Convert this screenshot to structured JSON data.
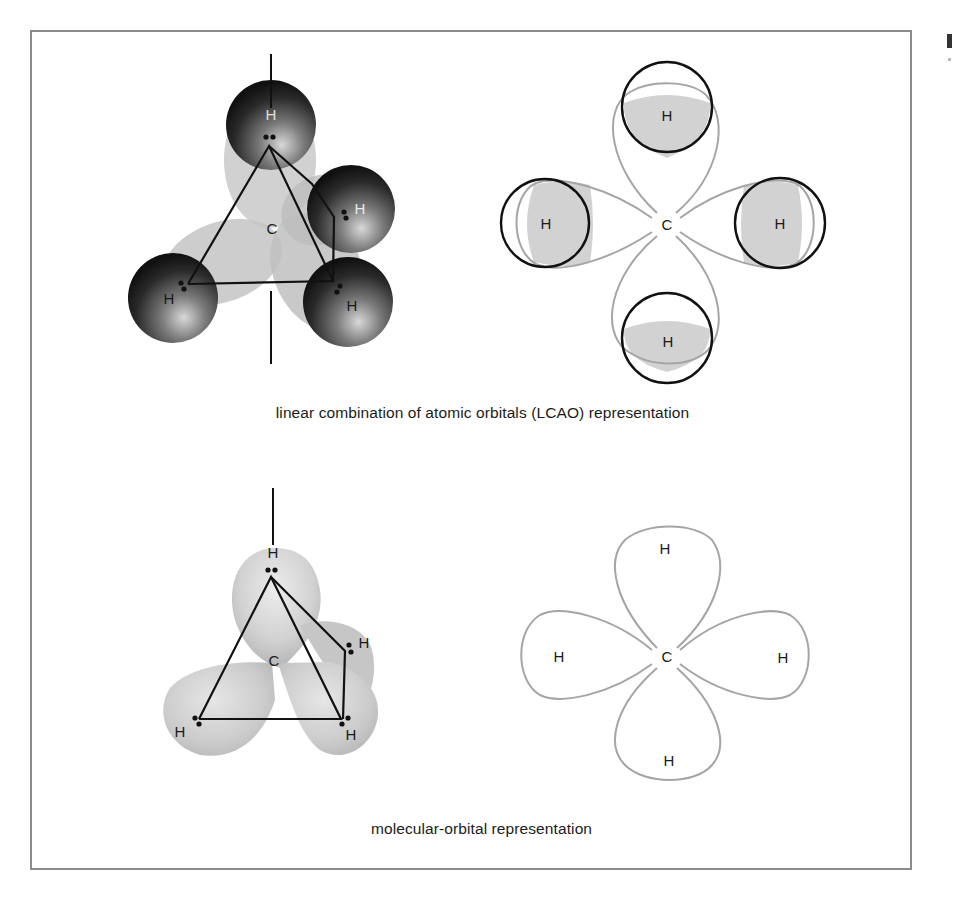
{
  "figure": {
    "type": "chemistry-diagram",
    "panels": [
      {
        "id": "lcao",
        "caption": "linear combination of atomic orbitals (LCAO) representation",
        "perspective_view": {
          "center_label": "C",
          "hydrogen_labels": [
            "H",
            "H",
            "H",
            "H"
          ]
        },
        "planar_view": {
          "center_label": "C",
          "hydrogen_labels": [
            "H",
            "H",
            "H",
            "H"
          ]
        }
      },
      {
        "id": "mo",
        "caption": "molecular-orbital representation",
        "perspective_view": {
          "center_label": "C",
          "hydrogen_labels": [
            "H",
            "H",
            "H",
            "H"
          ]
        },
        "planar_view": {
          "center_label": "C",
          "hydrogen_labels": [
            "H",
            "H",
            "H",
            "H"
          ]
        }
      }
    ],
    "colors": {
      "frame": "#8c8c8c",
      "lobe_fill": "#c8c8c8",
      "lobe_stroke": "#a8a8a8",
      "h_sphere_dark": "#1a1a1a",
      "overlap_fill": "#d0d0d0",
      "bond_line": "#111111"
    }
  }
}
